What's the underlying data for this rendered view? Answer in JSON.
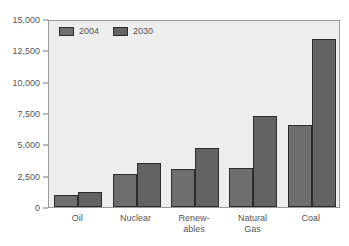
{
  "chart_data": {
    "type": "bar",
    "title": "",
    "subtitle": "",
    "xlabel": "",
    "ylabel": "",
    "categories": [
      "Oil",
      "Nuclear",
      "Renew-\nables",
      "Natural\nGas",
      "Coal"
    ],
    "series": [
      {
        "name": "2004",
        "values": [
          950,
          2600,
          3050,
          3100,
          6550
        ],
        "color": "#6e6e6e"
      },
      {
        "name": "2030",
        "values": [
          1200,
          3550,
          4700,
          7250,
          13400
        ],
        "color": "#636363"
      }
    ],
    "ylim": [
      0,
      15000
    ],
    "yticks": [
      0,
      2500,
      5000,
      7500,
      10000,
      12500,
      15000
    ],
    "ytick_labels": [
      "0",
      "2,500",
      "5,000",
      "7,500",
      "10,000",
      "12,500",
      "15,000"
    ],
    "grid": false,
    "legend_position": "top-left",
    "plot_background": "#ededed",
    "axis_color": "#9a9a9a",
    "text_color": "#555555"
  }
}
